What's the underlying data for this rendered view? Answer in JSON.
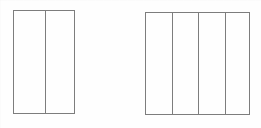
{
  "figure_set": {
    "title": "Two partitioned rectangle area models",
    "background_color": "#ffffff",
    "line_color": "#7d7d7d",
    "line_width_px": 1,
    "canvas": {
      "width": 261,
      "height": 128
    }
  },
  "chart_data": {
    "type": "diagram",
    "title": "",
    "xlabel": "",
    "ylabel": "",
    "shapes": [
      {
        "name": "left-rectangle",
        "label": "",
        "x": 13,
        "y": 10,
        "width": 62,
        "height": 104,
        "partitions": 2,
        "orientation": "vertical",
        "fraction_unit": "1/2",
        "shaded_count": 0,
        "divider_x_positions": [
          45
        ]
      },
      {
        "name": "right-rectangle",
        "label": "",
        "x": 145,
        "y": 12,
        "width": 105,
        "height": 103,
        "partitions": 4,
        "orientation": "vertical",
        "fraction_unit": "1/4",
        "shaded_count": 0,
        "divider_x_positions": [
          172,
          198,
          225
        ]
      }
    ],
    "annotations": [],
    "legend": []
  }
}
